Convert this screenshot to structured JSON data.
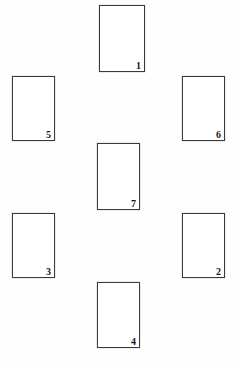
{
  "diagram": {
    "type": "numbered-rectangle-layout",
    "canvas": {
      "width": 239,
      "height": 367,
      "background_color": "#fefefe"
    },
    "style": {
      "stroke_color": "#3a3a3a",
      "stroke_width": 1,
      "fill_color": "#ffffff",
      "label_color": "#171717",
      "label_position": "bottom-right-inside"
    },
    "rectangles": [
      {
        "label": "1",
        "x": 99,
        "y": 5,
        "width": 46,
        "height": 67
      },
      {
        "label": "5",
        "x": 12,
        "y": 76,
        "width": 43,
        "height": 65
      },
      {
        "label": "6",
        "x": 182,
        "y": 76,
        "width": 43,
        "height": 65
      },
      {
        "label": "7",
        "x": 97,
        "y": 143,
        "width": 43,
        "height": 67
      },
      {
        "label": "3",
        "x": 12,
        "y": 213,
        "width": 43,
        "height": 65
      },
      {
        "label": "2",
        "x": 182,
        "y": 213,
        "width": 43,
        "height": 65
      },
      {
        "label": "4",
        "x": 97,
        "y": 282,
        "width": 43,
        "height": 66
      }
    ]
  }
}
